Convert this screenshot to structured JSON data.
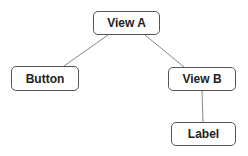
{
  "nodes": [
    {
      "id": "view-a",
      "label": "View A",
      "x": 93,
      "y": 11,
      "w": 67,
      "h": 24
    },
    {
      "id": "button",
      "label": "Button",
      "x": 11,
      "y": 66,
      "w": 68,
      "h": 25
    },
    {
      "id": "view-b",
      "label": "View B",
      "x": 168,
      "y": 67,
      "w": 68,
      "h": 24
    },
    {
      "id": "label",
      "label": "Label",
      "x": 171,
      "y": 122,
      "w": 65,
      "h": 24
    }
  ],
  "edges": [
    {
      "from": "View A",
      "to": "Button"
    },
    {
      "from": "View A",
      "to": "View B"
    },
    {
      "from": "View B",
      "to": "Label"
    }
  ]
}
